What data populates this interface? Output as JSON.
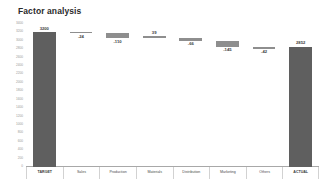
{
  "chart_data": {
    "type": "bar",
    "subtype": "waterfall",
    "title": "Factor analysis",
    "xlabel": "",
    "ylabel": "",
    "grid": false,
    "legend": false,
    "ylim": [
      0,
      3400
    ],
    "yticks": [
      0,
      200,
      400,
      600,
      800,
      1000,
      1200,
      1400,
      1600,
      1800,
      2000,
      2200,
      2400,
      2600,
      2800,
      3000,
      3200,
      3400
    ],
    "ytick_labels": [
      "0",
      "200",
      "400",
      "600",
      "800",
      "1000",
      "1200",
      "1400",
      "1600",
      "1800",
      "2000",
      "2200",
      "2400",
      "2600",
      "2800",
      "3000",
      "3200",
      "3400"
    ],
    "categories": [
      "TARGET",
      "Sales",
      "Production",
      "Materials",
      "Distribution",
      "Marketing",
      "Others",
      "ACTUAL"
    ],
    "values": [
      3200,
      -24,
      -110,
      39,
      -66,
      -145,
      -42,
      2852
    ],
    "value_labels": [
      "3200",
      "-24",
      "-110",
      "39",
      "-66",
      "-145",
      "-42",
      "2852"
    ],
    "bars": [
      {
        "category": "TARGET",
        "label": "3200",
        "value": 3200,
        "kind": "total",
        "base": 0,
        "top": 3200,
        "label_pos": "above",
        "color": "#5f5f5f"
      },
      {
        "category": "Sales",
        "label": "-24",
        "value": -24,
        "kind": "delta",
        "base": 3176,
        "top": 3200,
        "label_pos": "below",
        "color": "#8e8e8e"
      },
      {
        "category": "Production",
        "label": "-110",
        "value": -110,
        "kind": "delta",
        "base": 3066,
        "top": 3176,
        "label_pos": "below",
        "color": "#8e8e8e"
      },
      {
        "category": "Materials",
        "label": "39",
        "value": 39,
        "kind": "delta",
        "base": 3066,
        "top": 3105,
        "label_pos": "above",
        "color": "#8e8e8e"
      },
      {
        "category": "Distribution",
        "label": "-66",
        "value": -66,
        "kind": "delta",
        "base": 3000,
        "top": 3066,
        "label_pos": "below",
        "color": "#8e8e8e"
      },
      {
        "category": "Marketing",
        "label": "-145",
        "value": -145,
        "kind": "delta",
        "base": 2855,
        "top": 3000,
        "label_pos": "below",
        "color": "#8e8e8e"
      },
      {
        "category": "Others",
        "label": "-42",
        "value": -42,
        "kind": "delta",
        "base": 2813,
        "top": 2855,
        "label_pos": "below",
        "color": "#8e8e8e"
      },
      {
        "category": "ACTUAL",
        "label": "2852",
        "value": 2852,
        "kind": "total",
        "base": 0,
        "top": 2852,
        "label_pos": "above",
        "color": "#5f5f5f"
      }
    ],
    "colors": {
      "total_bar": "#5f5f5f",
      "delta_bar": "#8e8e8e",
      "axis": "#a8a8a8",
      "separator": "#d2d2d2",
      "title_text": "#2b2b2b",
      "value_text": "#3b3b3b",
      "tick_text": "#9a9a9a",
      "background": "#ffffff"
    }
  }
}
